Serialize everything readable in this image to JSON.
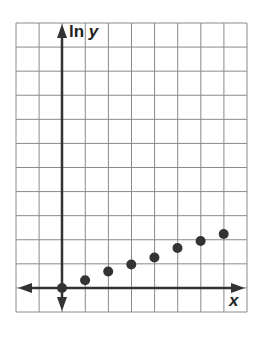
{
  "chart_data": {
    "type": "scatter",
    "title": "",
    "xlabel": "x",
    "ylabel_prefix": "ln ",
    "ylabel_var": "y",
    "ylabel": "ln y",
    "grid": true,
    "grid_cells": {
      "columns": 10,
      "rows": 12
    },
    "axis_ranges": {
      "x": [
        -2,
        8
      ],
      "y": [
        -1,
        11
      ]
    },
    "tick_labels": [],
    "points": [
      {
        "x": 0,
        "y": 0
      },
      {
        "x": 1,
        "y": 0.33
      },
      {
        "x": 2,
        "y": 0.7
      },
      {
        "x": 3,
        "y": 1.0
      },
      {
        "x": 4,
        "y": 1.3
      },
      {
        "x": 5,
        "y": 1.7
      },
      {
        "x": 6,
        "y": 2.0
      },
      {
        "x": 7,
        "y": 2.3
      }
    ],
    "colors": {
      "grid": "#8a8a8a",
      "axis": "#333333",
      "point": "#333333"
    }
  }
}
